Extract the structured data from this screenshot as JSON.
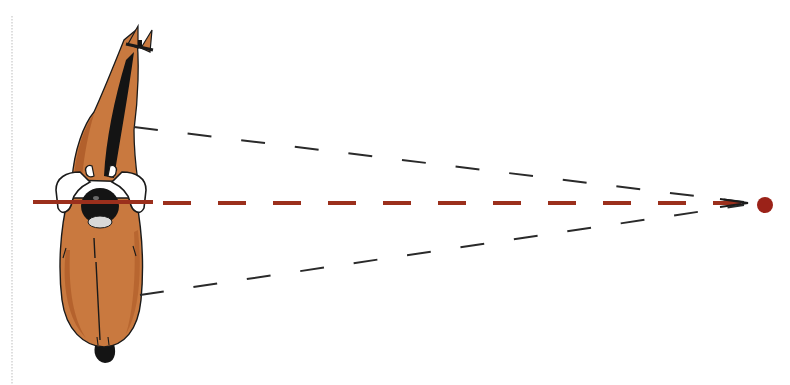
{
  "figure": {
    "elements": {
      "horse": "horse-with-rider-top-view",
      "center_line": "rider-line-of-sight",
      "upper_sight_line": "upper-peripheral-line",
      "lower_sight_line": "lower-peripheral-line",
      "target": "focal-point"
    },
    "colors": {
      "horse_coat": "#c9793f",
      "horse_shadow": "#a4501f",
      "outline": "#1a1a1a",
      "center_line": "#9b2f1c",
      "sight_lines": "#2a2a2a",
      "target": "#9b2218",
      "rider_white": "#ffffff",
      "guide_line": "#c8c8c8"
    }
  }
}
